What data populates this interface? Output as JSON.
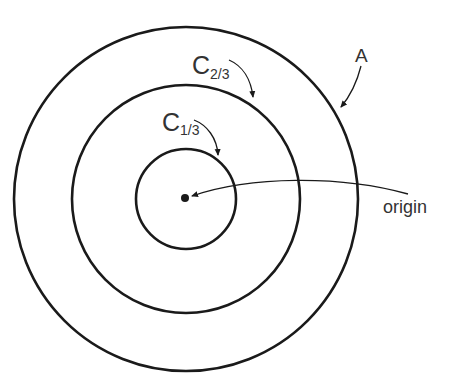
{
  "diagram": {
    "circles": [
      {
        "id": "A",
        "label": "A",
        "radius_px": 172
      },
      {
        "id": "C_2_3",
        "label_main": "C",
        "label_sub": "2/3",
        "radius_px": 115
      },
      {
        "id": "C_1_3",
        "label_main": "C",
        "label_sub": "1/3",
        "radius_px": 50
      }
    ],
    "origin_label": "origin",
    "colors": {
      "stroke": "#1a1a1a",
      "text": "#333333",
      "background": "#ffffff"
    }
  }
}
